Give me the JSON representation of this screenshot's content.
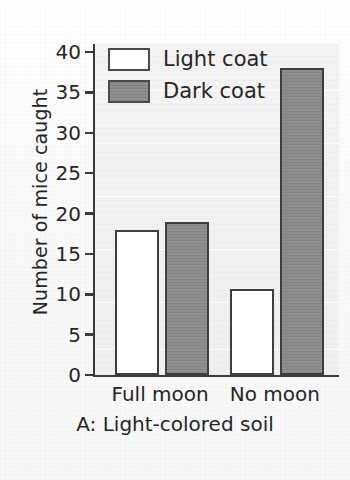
{
  "chart_data": {
    "type": "bar",
    "title": "",
    "subtitle": "",
    "categories": [
      "Full moon",
      "No moon"
    ],
    "series": [
      {
        "name": "Light coat",
        "values": [
          18,
          10.7
        ],
        "color": "#ffffff"
      },
      {
        "name": "Dark coat",
        "values": [
          19,
          38
        ],
        "color": "#8a8a8a"
      }
    ],
    "xlabel": "A: Light-colored soil",
    "ylabel": "Number of mice caught",
    "ylim": [
      0,
      41
    ],
    "yticks": [
      0,
      5,
      10,
      15,
      20,
      25,
      30,
      35,
      40
    ],
    "ytick_labels": [
      "0",
      "5",
      "10",
      "15",
      "20",
      "25",
      "30",
      "35",
      "40"
    ],
    "grid": false,
    "legend_position": "upper-left-inside",
    "legend_entries": [
      "Light coat",
      "Dark coat"
    ],
    "annotations": []
  },
  "axes": {
    "y_title": "Number of mice caught",
    "x_caption": "A: Light-colored soil"
  },
  "legend": {
    "items": [
      {
        "label": "Light coat",
        "swatch": "white-rectangle"
      },
      {
        "label": "Dark coat",
        "swatch": "gray-rectangle"
      }
    ]
  },
  "colors": {
    "bar_dark_fill": "#8a8a8a",
    "bar_light_fill": "#ffffff",
    "bar_outline": "#3f3f3f",
    "axis": "#3a3a3a",
    "text": "#262626",
    "plot_background": "#f1f1f1",
    "page_background": "#fbfbfb"
  }
}
